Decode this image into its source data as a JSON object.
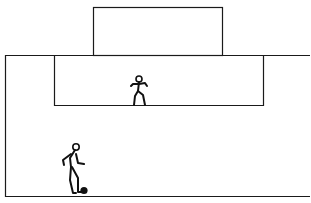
{
  "diagram": {
    "line_color": "#1a1a1a",
    "ball_color": "#111111",
    "elements": [
      {
        "name": "goal",
        "shape": "rectangle"
      },
      {
        "name": "penalty-area",
        "shape": "rectangle"
      },
      {
        "name": "pitch-boundary",
        "shape": "lines"
      },
      {
        "name": "goalkeeper",
        "shape": "stick-figure"
      },
      {
        "name": "attacker",
        "shape": "stick-figure"
      },
      {
        "name": "ball",
        "shape": "circle"
      }
    ]
  }
}
